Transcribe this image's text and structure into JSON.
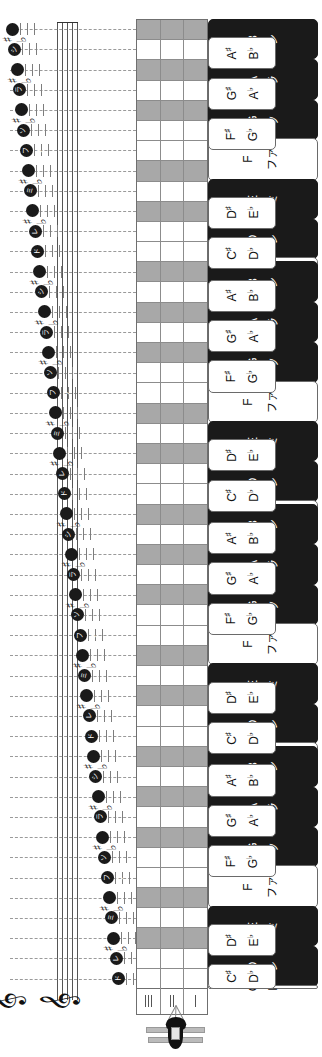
{
  "diagram": {
    "colors": {
      "black_key": "#1a1a1a",
      "white_key": "#ffffff",
      "grid_sharp_row": "#a8a8a8",
      "grid_line": "#8c8c8c",
      "staff_line": "#7d7d7d",
      "note_head": "#1a1a1a"
    }
  },
  "keyboard": {
    "octaves": 4,
    "keys": [
      {
        "type": "black-wide",
        "sharp": "A#",
        "flat": "B♭",
        "letter": "B",
        "kana": "シ"
      },
      {
        "type": "black-wide",
        "sharp": "G#",
        "flat": "A♭",
        "letter": "A",
        "kana": "ラ"
      },
      {
        "type": "black-wide",
        "sharp": "F#",
        "flat": "G♭",
        "letter": "G",
        "kana": "ソ"
      },
      {
        "type": "white",
        "sharp": "",
        "flat": "",
        "letter": "F",
        "kana": "ファ"
      },
      {
        "type": "black-wide",
        "sharp": "D#",
        "flat": "E♭",
        "letter": "E",
        "kana": "ミ"
      },
      {
        "type": "black-wide",
        "sharp": "C#",
        "flat": "D♭",
        "letter": "D",
        "kana": "レ"
      },
      {
        "type": "white",
        "sharp": "",
        "flat": "",
        "letter": "C",
        "kana": "ド"
      }
    ],
    "accidental_keys": [
      {
        "sharp": "A♯",
        "flat": "B♭"
      },
      {
        "sharp": "G♯",
        "flat": "A♭"
      },
      {
        "sharp": "F♯",
        "flat": "G♭"
      },
      {
        "sharp": "D♯",
        "flat": "E♭"
      },
      {
        "sharp": "C♯",
        "flat": "D♭"
      }
    ]
  },
  "grid": {
    "columns": 3,
    "rows_per_octave": 12,
    "sharp_rows": [
      0,
      2,
      4,
      7,
      9
    ],
    "foot_ticks": [
      3,
      2,
      1
    ]
  },
  "staff": {
    "clef": "𝄞",
    "clef_count": 2,
    "systems": 4,
    "note_kana_sequence": [
      "シ",
      "ラ",
      "ソ",
      "ファ",
      "ミ",
      "レ",
      "ド",
      "シ",
      "ラ",
      "ソ",
      "ファ",
      "ミ",
      "レ",
      "ド",
      "シ",
      "ラ",
      "ソ",
      "ファ",
      "ミ",
      "レ",
      "ド",
      "シ",
      "ラ",
      "ソ",
      "ファ",
      "ミ",
      "レ",
      "ド"
    ],
    "accidental_sharp": "♯",
    "accidental_flat": "♭"
  },
  "tuner": {
    "label": "tuning-peg-icon"
  }
}
